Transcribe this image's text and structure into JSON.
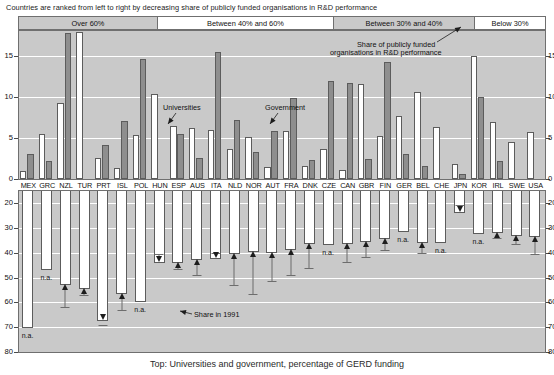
{
  "header": {
    "subtitle": "Countries are ranked from left to right by decreasing share of publicly funded organisations in R&D performance"
  },
  "categories_band": [
    {
      "label": "Over 60%",
      "style": "grey"
    },
    {
      "label": "Between 40% and 60%",
      "style": "white"
    },
    {
      "label": "Between 30% and 40%",
      "style": "grey"
    },
    {
      "label": "Below 30%",
      "style": "white"
    }
  ],
  "annotations": {
    "universities": "Universities",
    "government": "Government",
    "share_publicly_funded_line1": "Share of publicly funded",
    "share_publicly_funded_line2": "organisations in R&D performance",
    "share_1991": "Share in 1991",
    "na": "n.a."
  },
  "caption": "Top: Universities and government, percentage of GERD funding",
  "chart_data": {
    "type": "bar",
    "title": "",
    "subtitle": "Countries are ranked from left to right by decreasing share of publicly funded organisations in R&D performance",
    "categories": [
      "MEX",
      "GRC",
      "NZL",
      "TUR",
      "PRT",
      "ISL",
      "POL",
      "HUN",
      "ESP",
      "AUS",
      "ITA",
      "NLD",
      "NOR",
      "AUT",
      "FRA",
      "DNK",
      "CZE",
      "CAN",
      "GBR",
      "FIN",
      "GER",
      "BEL",
      "CHE",
      "JPN",
      "KOR",
      "IRL",
      "SWE",
      "USA"
    ],
    "panels": [
      {
        "name": "top",
        "ylabel": "",
        "ylim": [
          0,
          18
        ],
        "yticks": [
          0,
          5,
          10,
          15
        ],
        "grid": true,
        "series": [
          {
            "name": "Universities",
            "color": "#ffffff",
            "values": [
              1.0,
              5.5,
              9.2,
              17.9,
              2.5,
              1.3,
              5.3,
              10.3,
              6.5,
              6.2,
              5.9,
              3.6,
              5.1,
              1.4,
              5.8,
              1.6,
              3.7,
              1.1,
              11.6,
              5.2,
              7.7,
              10.6,
              6.3,
              1.8,
              14.9,
              6.9,
              4.5,
              5.7
            ]
          },
          {
            "name": "Government",
            "color": "#8e8e8e",
            "values": [
              3.1,
              2.2,
              17.8,
              0.0,
              4.1,
              7.1,
              14.6,
              0.0,
              5.5,
              2.6,
              15.5,
              7.2,
              3.3,
              5.8,
              9.8,
              2.3,
              11.9,
              11.7,
              2.4,
              14.2,
              3.0,
              1.6,
              0.0,
              0.6,
              10.0,
              2.2,
              0.0,
              0.0
            ]
          }
        ]
      },
      {
        "name": "bottom",
        "ylabel": "",
        "ylim_inverted": [
          15,
          80
        ],
        "yticks": [
          20,
          30,
          40,
          50,
          60,
          70,
          80
        ],
        "grid": true,
        "series": [
          {
            "name": "Share of publicly funded organisations in R&D performance",
            "color": "#ffffff",
            "values": [
              70.5,
              47.0,
              53.0,
              54.5,
              67.5,
              56.5,
              60.0,
              44.0,
              44.0,
              43.0,
              42.5,
              40.5,
              39.5,
              40.0,
              39.0,
              36.5,
              37.0,
              36.5,
              35.5,
              34.5,
              31.5,
              36.0,
              36.0,
              24.0,
              32.5,
              32.0,
              33.0,
              33.5
            ]
          },
          {
            "name": "Share in 1991",
            "marker": "triangle",
            "values": [
              null,
              null,
              62.0,
              57.0,
              69.0,
              63.0,
              null,
              40.5,
              46.5,
              49.0,
              40.0,
              53.0,
              56.5,
              51.5,
              49.0,
              46.0,
              null,
              43.5,
              41.5,
              39.0,
              null,
              40.0,
              null,
              20.5,
              null,
              34.0,
              36.5,
              40.5
            ],
            "directions": [
              null,
              null,
              "up",
              "up",
              "down",
              "up",
              null,
              "down",
              "up",
              "up",
              "down",
              "up",
              "up",
              "up",
              "up",
              "up",
              null,
              "up",
              "up",
              "up",
              null,
              "up",
              null,
              "down",
              null,
              "up",
              "up",
              "up"
            ]
          }
        ],
        "na_countries": [
          "MEX",
          "GRC",
          "POL",
          "CZE",
          "GER",
          "CHE",
          "KOR"
        ]
      }
    ]
  }
}
